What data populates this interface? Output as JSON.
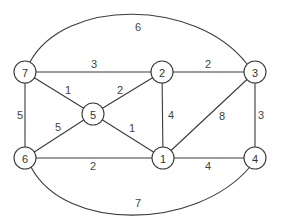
{
  "diagram": {
    "type": "weighted-undirected-graph",
    "nodes": [
      {
        "id": "1",
        "label": "1",
        "x": 163,
        "y": 158
      },
      {
        "id": "2",
        "label": "2",
        "x": 162,
        "y": 72
      },
      {
        "id": "3",
        "label": "3",
        "x": 255,
        "y": 72
      },
      {
        "id": "4",
        "label": "4",
        "x": 255,
        "y": 158
      },
      {
        "id": "5",
        "label": "5",
        "x": 93,
        "y": 114
      },
      {
        "id": "6",
        "label": "6",
        "x": 25,
        "y": 158
      },
      {
        "id": "7",
        "label": "7",
        "x": 25,
        "y": 72
      }
    ],
    "edges": [
      {
        "from": "7",
        "to": "2",
        "weight": "3",
        "lx": 94,
        "ly": 64
      },
      {
        "from": "2",
        "to": "3",
        "weight": "2",
        "lx": 208,
        "ly": 64
      },
      {
        "from": "7",
        "to": "6",
        "weight": "5",
        "lx": 20,
        "ly": 115
      },
      {
        "from": "7",
        "to": "5",
        "weight": "1",
        "lx": 68,
        "ly": 90
      },
      {
        "from": "5",
        "to": "2",
        "weight": "2",
        "lx": 120,
        "ly": 90
      },
      {
        "from": "2",
        "to": "1",
        "weight": "4",
        "lx": 171,
        "ly": 115
      },
      {
        "from": "3",
        "to": "1",
        "weight": "8",
        "lx": 222,
        "ly": 116
      },
      {
        "from": "3",
        "to": "4",
        "weight": "3",
        "lx": 261,
        "ly": 115
      },
      {
        "from": "5",
        "to": "6",
        "weight": "5",
        "lx": 58,
        "ly": 127
      },
      {
        "from": "5",
        "to": "1",
        "weight": "1",
        "lx": 132,
        "ly": 128
      },
      {
        "from": "6",
        "to": "1",
        "weight": "2",
        "lx": 93,
        "ly": 166
      },
      {
        "from": "1",
        "to": "4",
        "weight": "4",
        "lx": 208,
        "ly": 166
      },
      {
        "from": "7",
        "to": "3",
        "weight": "6",
        "curved": "top",
        "lx": 138,
        "ly": 27
      },
      {
        "from": "6",
        "to": "4",
        "weight": "7",
        "curved": "bottom",
        "lx": 138,
        "ly": 203
      }
    ]
  }
}
